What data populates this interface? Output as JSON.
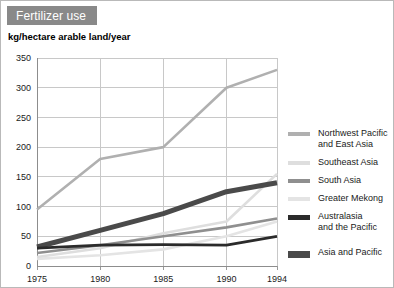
{
  "figure": {
    "title": "Fertilizer use",
    "title_bg": "#898989",
    "title_color": "#ffffff",
    "border_color": "#b9b9b9",
    "background": "#ffffff"
  },
  "chart_data": {
    "type": "line",
    "title": "Fertilizer use",
    "ylabel": "kg/hectare arable land/year",
    "xlabel": "",
    "x": [
      1975,
      1980,
      1985,
      1990,
      1994
    ],
    "xtick_labels": [
      "1975",
      "1980",
      "1985",
      "1990",
      "1994"
    ],
    "ytick_labels": [
      "0",
      "50",
      "100",
      "150",
      "200",
      "250",
      "300",
      "350"
    ],
    "yticks": [
      0,
      50,
      100,
      150,
      200,
      250,
      300,
      350
    ],
    "ylim": [
      0,
      350
    ],
    "xlim": [
      1975,
      1994
    ],
    "grid": true,
    "legend_position": "right",
    "series": [
      {
        "name": "Northwest Pacific\nand East Asia",
        "color": "#b0b0b0",
        "width": 2.6,
        "values": [
          95,
          180,
          200,
          300,
          330
        ]
      },
      {
        "name": "Southeast Asia",
        "color": "#dedede",
        "width": 2.6,
        "values": [
          15,
          30,
          55,
          75,
          155
        ]
      },
      {
        "name": "South Asia",
        "color": "#8f8f8f",
        "width": 2.6,
        "values": [
          22,
          35,
          50,
          65,
          80
        ]
      },
      {
        "name": "Greater Mekong",
        "color": "#e4e4e4",
        "width": 2.6,
        "values": [
          12,
          18,
          28,
          50,
          75
        ]
      },
      {
        "name": "Australasia\nand the Pacific",
        "color": "#2b2b2b",
        "width": 2.8,
        "values": [
          30,
          35,
          36,
          35,
          50
        ]
      },
      {
        "name": "Asia and Pacific",
        "color": "#4a4a4a",
        "width": 5.0,
        "values": [
          32,
          60,
          88,
          125,
          140
        ]
      }
    ]
  },
  "legend": {
    "items": [
      {
        "label": "Northwest Pacific\nand East Asia",
        "color": "#b0b0b0",
        "thickness": 4
      },
      {
        "label": "Southeast Asia",
        "color": "#dedede",
        "thickness": 4
      },
      {
        "label": "South Asia",
        "color": "#8f8f8f",
        "thickness": 4
      },
      {
        "label": "Greater Mekong",
        "color": "#e4e4e4",
        "thickness": 4
      },
      {
        "label": "Australasia\nand the Pacific",
        "color": "#2b2b2b",
        "thickness": 5
      },
      {
        "label": "Asia and Pacific",
        "color": "#4a4a4a",
        "thickness": 7
      }
    ]
  }
}
